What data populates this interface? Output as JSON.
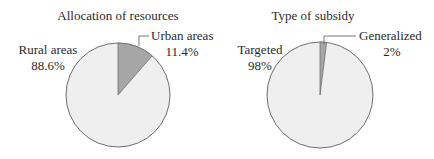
{
  "chart_data": [
    {
      "type": "pie",
      "title": "Allocation of resources",
      "slices": [
        {
          "label": "Urban areas",
          "value": 11.4,
          "display": "11.4%",
          "color": "#a6a6a6"
        },
        {
          "label": "Rural areas",
          "value": 88.6,
          "display": "88.6%",
          "color": "#efefef"
        }
      ],
      "start_angle": "12 o'clock, clockwise"
    },
    {
      "type": "pie",
      "title": "Type of subsidy",
      "slices": [
        {
          "label": "Generalized",
          "value": 2,
          "display": "2%",
          "color": "#a6a6a6"
        },
        {
          "label": "Targeted",
          "value": 98,
          "display": "98%",
          "color": "#efefef"
        }
      ],
      "start_angle": "12 o'clock, clockwise"
    }
  ],
  "charts": {
    "left": {
      "title": "Allocation of resources",
      "small": {
        "name": "Urban areas",
        "pct": "11.4%"
      },
      "large": {
        "name": "Rural areas",
        "pct": "88.6%"
      }
    },
    "right": {
      "title": "Type of subsidy",
      "small": {
        "name": "Generalized",
        "pct": "2%"
      },
      "large": {
        "name": "Targeted",
        "pct": "98%"
      }
    }
  },
  "colors": {
    "small_slice": "#a6a6a6",
    "large_slice": "#efefef",
    "outline": "#6e6e6e"
  }
}
